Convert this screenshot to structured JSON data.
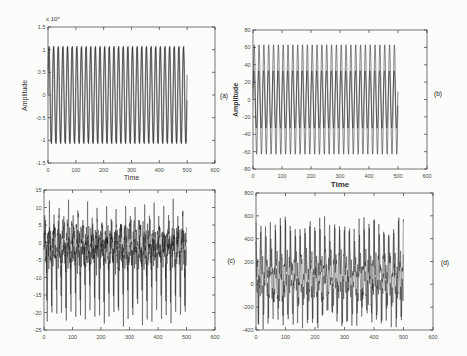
{
  "figure": {
    "type": "matlab-style-figure",
    "background": "#fcfcfa",
    "axis_color": "#3a3a3a",
    "line_color": "#161616",
    "tick_label_color": "#4a4a4a"
  },
  "chart_data": [
    {
      "id": "a",
      "type": "line",
      "annotation": "(a)",
      "xlabel": "Time",
      "ylabel": "Amplitude",
      "y_multiplier": "x 10⁴",
      "xlim": [
        0,
        600
      ],
      "ylim": [
        -1.5,
        1.5
      ],
      "xticks": [
        0,
        100,
        200,
        300,
        400,
        500,
        600
      ],
      "yticks": [
        1.5,
        1,
        0.5,
        0,
        -0.5,
        -1,
        -1.5
      ],
      "x_data_range": [
        0,
        500
      ],
      "sample_step": 0.35,
      "line_width": 0.55,
      "signal_summary": "Two overlaid sinusoids, amplitude ~1.08 x 10^4, ~30 cycles over t = 0..500",
      "series": [
        {
          "name": "trace-1",
          "offset": 0,
          "components": [
            {
              "A": 1.08,
              "T": 16.67,
              "phase": 0
            }
          ]
        },
        {
          "name": "trace-2",
          "offset": 0,
          "components": [
            {
              "A": 1.05,
              "T": 16.67,
              "phase": 0.55
            }
          ]
        }
      ]
    },
    {
      "id": "b",
      "type": "line",
      "annotation": "(b)",
      "xlabel": "Time",
      "ylabel": "Amplitude",
      "y_multiplier": "",
      "xlim": [
        0,
        600
      ],
      "ylim": [
        -80,
        80
      ],
      "xticks": [
        0,
        100,
        200,
        300,
        400,
        500,
        600
      ],
      "yticks": [
        80,
        60,
        40,
        20,
        0,
        -20,
        -40,
        -60,
        -80
      ],
      "x_data_range": [
        0,
        500
      ],
      "sample_step": 0.35,
      "line_width": 0.55,
      "signal_summary": "Two overlaid sinusoids, peak amplitudes ~63 and ~33, ~30 cycles over t = 0..500",
      "series": [
        {
          "name": "trace-1",
          "offset": 0,
          "components": [
            {
              "A": 63,
              "T": 16.67,
              "phase": 0
            }
          ]
        },
        {
          "name": "trace-2",
          "offset": 0,
          "components": [
            {
              "A": 33,
              "T": 16.67,
              "phase": 0.4
            }
          ]
        }
      ]
    },
    {
      "id": "c",
      "type": "line",
      "annotation": "(c)",
      "xlabel": "",
      "ylabel": "",
      "y_multiplier": "",
      "xlim": [
        0,
        600
      ],
      "ylim": [
        -25,
        15
      ],
      "xticks": [
        0,
        100,
        200,
        300,
        400,
        500,
        600
      ],
      "yticks": [
        15,
        10,
        5,
        0,
        -5,
        -10,
        -15,
        -20,
        -25
      ],
      "x_data_range": [
        0,
        500
      ],
      "sample_step": 0.3,
      "line_width": 0.45,
      "signal_summary": "Dense multi-frequency signal, band ~-7..+6 with upward spikes to ~+11 and periodic downward spikes to ~-22",
      "series": [
        {
          "name": "trace-1",
          "offset": -1,
          "components": [
            {
              "A": 3,
              "T": 16.7,
              "phase": 0
            },
            {
              "A": 2.2,
              "T": 4.77,
              "phase": 1.1
            },
            {
              "A": 1.6,
              "T": 2.31,
              "phase": 0.4
            },
            {
              "A": 1.1,
              "T": 1.37,
              "phase": 2.6
            },
            {
              "A": -17,
              "T": 16.7,
              "phase": 3.6,
              "pow": 12
            },
            {
              "A": -5,
              "T": 8.35,
              "phase": 1.2,
              "pow": 8
            },
            {
              "A": 6.5,
              "T": 16.7,
              "phase": 0.7,
              "pow": 10
            }
          ]
        },
        {
          "name": "trace-2",
          "offset": -1,
          "components": [
            {
              "A": 2.6,
              "T": 16.7,
              "phase": 2.2
            },
            {
              "A": 1.8,
              "T": 3.9,
              "phase": 0.3
            },
            {
              "A": 1.2,
              "T": 1.73,
              "phase": 1.9
            },
            {
              "A": -14,
              "T": 16.7,
              "phase": 4.1,
              "pow": 12
            },
            {
              "A": 5,
              "T": 15.6,
              "phase": 0.2,
              "pow": 10
            }
          ]
        }
      ]
    },
    {
      "id": "d",
      "type": "line",
      "annotation": "(d)",
      "xlabel": "",
      "ylabel": "",
      "y_multiplier": "",
      "xlim": [
        0,
        600
      ],
      "ylim": [
        -400,
        800
      ],
      "xticks": [
        0,
        100,
        200,
        300,
        400,
        500,
        600
      ],
      "yticks": [
        800,
        600,
        400,
        200,
        0,
        -200,
        -400
      ],
      "x_data_range": [
        0,
        500
      ],
      "sample_step": 0.3,
      "line_width": 0.45,
      "signal_summary": "Dense multi-frequency signal, band ~-100..+250 with upward spikes to ~+650 and downward spikes to ~-300",
      "series": [
        {
          "name": "trace-1",
          "offset": 70,
          "components": [
            {
              "A": 120,
              "T": 16.7,
              "phase": 0
            },
            {
              "A": 70,
              "T": 5.9,
              "phase": 1.3
            },
            {
              "A": 45,
              "T": 3.1,
              "phase": 0.2
            },
            {
              "A": 28,
              "T": 1.9,
              "phase": 2.2
            },
            {
              "A": 380,
              "T": 16.7,
              "phase": 1.6,
              "pow": 6
            },
            {
              "A": -300,
              "T": 16.7,
              "phase": 4.5,
              "pow": 8
            }
          ]
        },
        {
          "name": "trace-2",
          "offset": 60,
          "components": [
            {
              "A": 130,
              "T": 16.7,
              "phase": 2.4
            },
            {
              "A": 60,
              "T": 4.3,
              "phase": 0.8
            },
            {
              "A": 35,
              "T": 2.3,
              "phase": 1.5
            },
            {
              "A": 330,
              "T": 16.7,
              "phase": 2.0,
              "pow": 8
            },
            {
              "A": -250,
              "T": 16.7,
              "phase": 5.0,
              "pow": 10
            }
          ]
        }
      ]
    }
  ]
}
